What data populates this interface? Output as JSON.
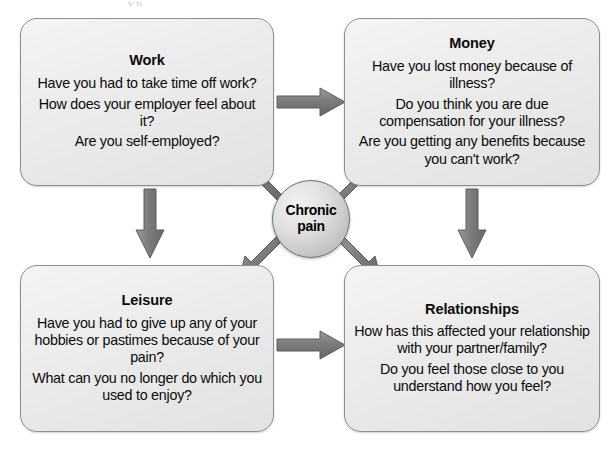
{
  "diagram": {
    "center": {
      "label_line1": "Chronic",
      "label_line2": "pain"
    },
    "colors": {
      "box_fill": "#ebebeb",
      "box_border": "#8e8e8e",
      "arrow": "#7a7a7a",
      "arrow_outline": "#5d5d5d",
      "text": "#0b0b0b",
      "background": "#ffffff"
    },
    "boxes": [
      {
        "id": "work",
        "title": "Work",
        "questions": [
          "Have you had to take time off work?",
          "How does your employer feel about it?",
          "Are you self-employed?"
        ]
      },
      {
        "id": "money",
        "title": "Money",
        "questions": [
          "Have you lost money because of illness?",
          "Do you think you are due compensation for your illness?",
          "Are you getting any benefits because you can't work?"
        ]
      },
      {
        "id": "leisure",
        "title": "Leisure",
        "questions": [
          "Have you had to give up any of your hobbies or pastimes because of your pain?",
          "What can you no longer do which you used to enjoy?"
        ]
      },
      {
        "id": "relationships",
        "title": "Relationships",
        "questions": [
          "How has this affected your relationship with your partner/family?",
          "Do you feel those close to you understand how you feel?"
        ]
      }
    ],
    "arrows": [
      {
        "id": "center-to-work",
        "from": "center",
        "to": "work",
        "direction": "up-left"
      },
      {
        "id": "center-to-money",
        "from": "center",
        "to": "money",
        "direction": "up-right"
      },
      {
        "id": "center-to-leisure",
        "from": "center",
        "to": "leisure",
        "direction": "down-left"
      },
      {
        "id": "center-to-relationships",
        "from": "center",
        "to": "relationships",
        "direction": "down-right"
      },
      {
        "id": "work-to-money",
        "from": "work",
        "to": "money",
        "direction": "right"
      },
      {
        "id": "work-to-leisure",
        "from": "work",
        "to": "leisure",
        "direction": "down"
      },
      {
        "id": "money-to-relationships",
        "from": "money",
        "to": "relationships",
        "direction": "down"
      },
      {
        "id": "leisure-to-relationships",
        "from": "leisure",
        "to": "relationships",
        "direction": "right"
      }
    ]
  }
}
